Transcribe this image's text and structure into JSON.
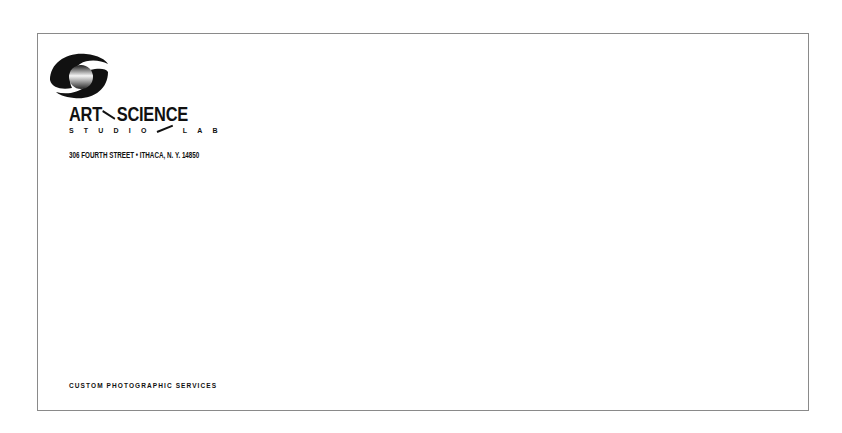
{
  "envelope": {
    "brand": {
      "logo_icon": "swirl-sphere-logo-icon",
      "name_left": "ART",
      "name_right": "SCIENCE",
      "sub_left": "STUDIO",
      "sub_right": "LAB",
      "address": "306 FOURTH STREET • ITHACA, N. Y. 14850"
    },
    "tagline": "CUSTOM PHOTOGRAPHIC SERVICES",
    "colors": {
      "ink": "#111111",
      "border": "#8a8a8a",
      "paper": "#ffffff"
    }
  }
}
